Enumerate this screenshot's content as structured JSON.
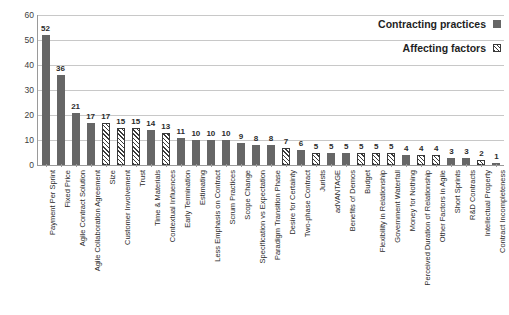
{
  "chart_data": {
    "type": "bar",
    "title": "",
    "subtitle": "",
    "xlabel": "",
    "ylabel": "",
    "ylim": [
      0,
      60
    ],
    "yticks": [
      0,
      10,
      20,
      30,
      40,
      50,
      60
    ],
    "grid": true,
    "legend_position": "top-right",
    "legend": [
      {
        "name": "Contracting practices",
        "pattern": "solid",
        "color": "#666666"
      },
      {
        "name": "Affecting factors",
        "pattern": "hatch",
        "color": "#3a3a3a"
      }
    ],
    "categories": [
      "Payment Per Sprint",
      "Fixed Price",
      "Agile Contract Solution",
      "Agile Collaboration Agreement",
      "Size",
      "Customer Involvement",
      "Trust",
      "Time & Materials",
      "Contextual Influences",
      "Early Termination",
      "Estimating",
      "Less Emphasis on Contract",
      "Scrum Practices",
      "Scope Change",
      "Specification vs Expectation",
      "Paradigm Transition Phase",
      "Desire for Certainty",
      "Two-phase Contract",
      "Jurists",
      "adVANTAGE",
      "Benefits of Demos",
      "Budget",
      "Flexibility in Relationship",
      "Government Waterfall",
      "Money for Nothing",
      "Perceived Duration of Relationship",
      "Other Factors in Agile",
      "Short Sprints",
      "R&D Contracts",
      "Intellectual Property",
      "Contract Incompleteness"
    ],
    "values": [
      52,
      36,
      21,
      17,
      17,
      15,
      15,
      14,
      13,
      11,
      10,
      10,
      10,
      9,
      8,
      8,
      7,
      6,
      5,
      5,
      5,
      5,
      5,
      5,
      4,
      4,
      4,
      3,
      3,
      2,
      1
    ],
    "series_of": [
      "Contracting practices",
      "Contracting practices",
      "Contracting practices",
      "Contracting practices",
      "Affecting factors",
      "Affecting factors",
      "Affecting factors",
      "Contracting practices",
      "Affecting factors",
      "Contracting practices",
      "Contracting practices",
      "Contracting practices",
      "Contracting practices",
      "Contracting practices",
      "Contracting practices",
      "Contracting practices",
      "Affecting factors",
      "Contracting practices",
      "Affecting factors",
      "Contracting practices",
      "Contracting practices",
      "Affecting factors",
      "Affecting factors",
      "Affecting factors",
      "Contracting practices",
      "Affecting factors",
      "Affecting factors",
      "Contracting practices",
      "Contracting practices",
      "Affecting factors",
      "Contracting practices"
    ]
  }
}
